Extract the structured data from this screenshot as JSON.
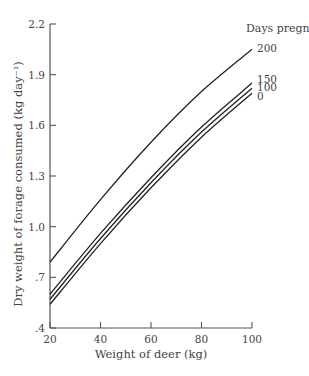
{
  "chart_data": {
    "type": "line",
    "title": "",
    "xlabel": "Weight of deer (kg)",
    "ylabel": "Dry weight of forage consumed (kg day⁻¹)",
    "xlim": [
      20,
      100
    ],
    "ylim": [
      0.4,
      2.2
    ],
    "x_ticks": [
      20,
      40,
      60,
      80,
      100
    ],
    "x_tick_labels": [
      "20",
      "40",
      "60",
      "80",
      "100"
    ],
    "y_ticks": [
      0.4,
      0.7,
      1.0,
      1.3,
      1.6,
      1.9,
      2.2
    ],
    "y_tick_labels": [
      ".4",
      ".7",
      "1.0",
      "1.3",
      "1.6",
      "1.9",
      "2.2"
    ],
    "grid": false,
    "legend_title": "Days pregnant",
    "legend_position": "top-right, labels at line ends",
    "x": [
      20,
      40,
      60,
      80,
      100
    ],
    "series": [
      {
        "name": "200",
        "values": [
          0.79,
          1.16,
          1.5,
          1.8,
          2.05
        ]
      },
      {
        "name": "150",
        "values": [
          0.6,
          0.96,
          1.29,
          1.59,
          1.85
        ]
      },
      {
        "name": "100",
        "values": [
          0.57,
          0.93,
          1.26,
          1.56,
          1.82
        ]
      },
      {
        "name": "0",
        "values": [
          0.54,
          0.9,
          1.23,
          1.53,
          1.79
        ]
      }
    ]
  }
}
